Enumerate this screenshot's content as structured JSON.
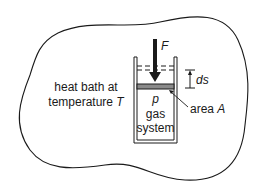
{
  "diagram": {
    "heat_bath": {
      "line1": "heat bath at",
      "line2_prefix": "temperature ",
      "line2_var": "T"
    },
    "force_label": "F",
    "displacement_label": "ds",
    "area": {
      "prefix": "area ",
      "var": "A"
    },
    "pressure_label": "p",
    "system": {
      "line1": "gas",
      "line2": "system"
    },
    "colors": {
      "stroke": "#1a1a1a",
      "piston_fill": "#8a8a8a",
      "background": "#ffffff"
    }
  }
}
